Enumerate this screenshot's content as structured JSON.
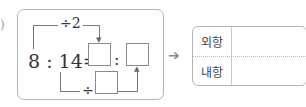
{
  "problem": {
    "stray_mark": ")",
    "expression": {
      "left_term": "8",
      "colon": ":",
      "right_term": "14",
      "equals": "=",
      "colon_right": ":"
    },
    "top_operation": "÷2",
    "bottom_operation": "÷",
    "arrow": "➔"
  },
  "answer_table": {
    "rows": [
      {
        "label": "외항",
        "value": ""
      },
      {
        "label": "내항",
        "value": ""
      }
    ]
  }
}
